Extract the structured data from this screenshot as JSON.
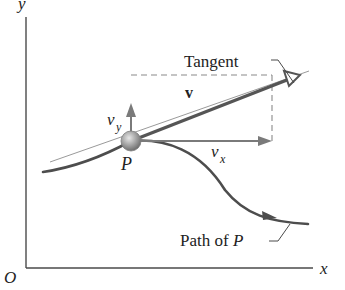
{
  "diagram": {
    "axes": {
      "y_label": "y",
      "x_label": "x",
      "origin_label": "O"
    },
    "particle": {
      "label": "P"
    },
    "vectors": {
      "velocity_label": "v",
      "vx_label": "v",
      "vx_subscript": "x",
      "vy_label": "v",
      "vy_subscript": "y"
    },
    "callouts": {
      "tangent_label": "Tangent",
      "path_label_prefix": "Path of ",
      "path_label_var": "P"
    },
    "colors": {
      "axis": "#4a4a4a",
      "path": "#4d4d4d",
      "velocity_vector": "#555555",
      "component_vectors": "#7a7a7a",
      "dashed_box": "#8a8a8a",
      "tangent_line": "#9a9a9a",
      "particle": "#9c9c9c",
      "text": "#222222"
    }
  }
}
